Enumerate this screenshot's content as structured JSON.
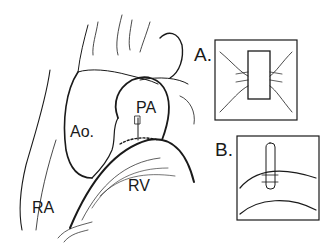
{
  "figure": {
    "labels": {
      "aorta": "Ao.",
      "pulmonary_artery": "PA",
      "right_ventricle": "RV",
      "right_atrium": "RA"
    },
    "insets": [
      {
        "id": "A",
        "label": "A."
      },
      {
        "id": "B",
        "label": "B."
      }
    ],
    "colors": {
      "ink": "#1a1a1a",
      "background": "#ffffff"
    }
  }
}
